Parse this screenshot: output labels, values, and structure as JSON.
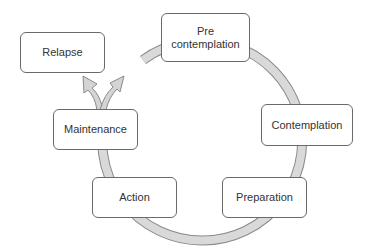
{
  "diagram": {
    "type": "cycle",
    "title": "",
    "stages": [
      {
        "id": "precontemplation",
        "label_line1": "Pre",
        "label_line2": "contemplation"
      },
      {
        "id": "contemplation",
        "label": "Contemplation"
      },
      {
        "id": "preparation",
        "label": "Preparation"
      },
      {
        "id": "action",
        "label": "Action"
      },
      {
        "id": "maintenance",
        "label": "Maintenance"
      },
      {
        "id": "relapse",
        "label": "Relapse"
      }
    ],
    "edges": [
      {
        "from": "precontemplation",
        "to": "contemplation"
      },
      {
        "from": "contemplation",
        "to": "preparation"
      },
      {
        "from": "preparation",
        "to": "action"
      },
      {
        "from": "action",
        "to": "maintenance"
      },
      {
        "from": "maintenance",
        "to": "relapse",
        "style": "arrow"
      },
      {
        "from": "maintenance",
        "to": "precontemplation",
        "style": "arrow"
      }
    ],
    "colors": {
      "ring_fill": "#d9d9d9",
      "ring_stroke": "#8a8a8a",
      "box_border": "#6a6a6a",
      "text": "#333333"
    }
  }
}
